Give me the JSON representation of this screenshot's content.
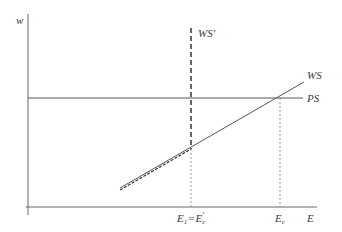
{
  "diagram": {
    "axes": {
      "y_label": "w",
      "x_label": "E"
    },
    "curves": {
      "ps": {
        "label": "PS",
        "style": "solid horizontal"
      },
      "ws": {
        "label": "WS",
        "style": "solid upward-sloping"
      },
      "ws_prime": {
        "label": "WS'",
        "style": "dashed, vertical above E1, coincides with WS below"
      }
    },
    "x_markers": {
      "e1": {
        "main": "E",
        "sub": "1",
        "eq": "=",
        "main2": "E",
        "sub2": "c",
        "prime": "'"
      },
      "ec": {
        "main": "E",
        "sub": "c"
      }
    },
    "colors": {
      "axis": "#555555",
      "line": "#555555",
      "dashed": "#333333",
      "dotted": "#999999",
      "text": "#3a3a3a"
    }
  }
}
